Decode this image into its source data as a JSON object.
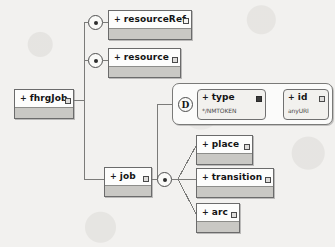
{
  "diagram": {
    "type": "xsd-tree",
    "line_color": "#7b7b79",
    "node_fill": "#fdfdfc",
    "node_body_fill": "#c9c8c4",
    "background": "#f2f1ef"
  },
  "root": {
    "label": "fhrgJob",
    "occurrence_marker": "+",
    "badge": "sequence-badge"
  },
  "connectors": [
    {
      "name": "connector-resourceref",
      "glyph": "sequence-dot"
    },
    {
      "name": "connector-resource",
      "glyph": "sequence-dot"
    },
    {
      "name": "connector-job-children",
      "glyph": "sequence-dot"
    }
  ],
  "elements": [
    {
      "label": "resourceRef",
      "occurrence_marker": "+",
      "badge": "hollow"
    },
    {
      "label": "resource",
      "occurrence_marker": "+",
      "badge": "filled"
    },
    {
      "label": "job",
      "occurrence_marker": "+",
      "badge": "filled"
    },
    {
      "label": "place",
      "occurrence_marker": "+",
      "badge": "filled"
    },
    {
      "label": "transition",
      "occurrence_marker": "+",
      "badge": "filled"
    },
    {
      "label": "arc",
      "occurrence_marker": "+",
      "badge": "filled"
    }
  ],
  "attribute_group": {
    "marker": "D",
    "marker_title": "attribute-group",
    "attributes": [
      {
        "label": "type",
        "occurrence_marker": "+",
        "datatype": "*/NMTOKEN",
        "badge": "solid"
      },
      {
        "label": "id",
        "occurrence_marker": "+",
        "datatype": "anyURI",
        "badge": "filled"
      }
    ]
  }
}
